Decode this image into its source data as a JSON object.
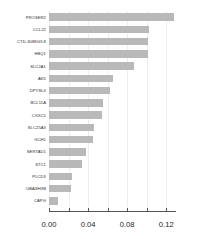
{
  "chart_data": {
    "type": "bar",
    "orientation": "horizontal",
    "title": "",
    "xlabel": "",
    "ylabel": "",
    "xlim": [
      0.0,
      0.13
    ],
    "ylim": null,
    "grid": true,
    "grid_axis": "x",
    "legend": false,
    "legend_position": "none",
    "bar_color": "#b9b9b9",
    "categories": [
      "PROSER2",
      "CCL22",
      "CTD-3088G3.8",
      "HBQ1",
      "SLC2A1",
      "AK5",
      "DPYSL4",
      "BCL11A",
      "CXXC5",
      "SLC25A3",
      "GCH1",
      "SERTAD1",
      "STC1",
      "PLCD3",
      "UBASH3B",
      "CAPG"
    ],
    "values": [
      0.128,
      0.102,
      0.101,
      0.101,
      0.087,
      0.065,
      0.062,
      0.055,
      0.054,
      0.046,
      0.045,
      0.038,
      0.034,
      0.024,
      0.023,
      0.009
    ],
    "x_ticks": [
      0.0,
      0.02,
      0.04,
      0.06,
      0.08,
      0.1,
      0.12
    ],
    "x_tick_labels": [
      "0.00",
      "",
      "0.04",
      "",
      "0.08",
      "",
      "0.12"
    ]
  }
}
